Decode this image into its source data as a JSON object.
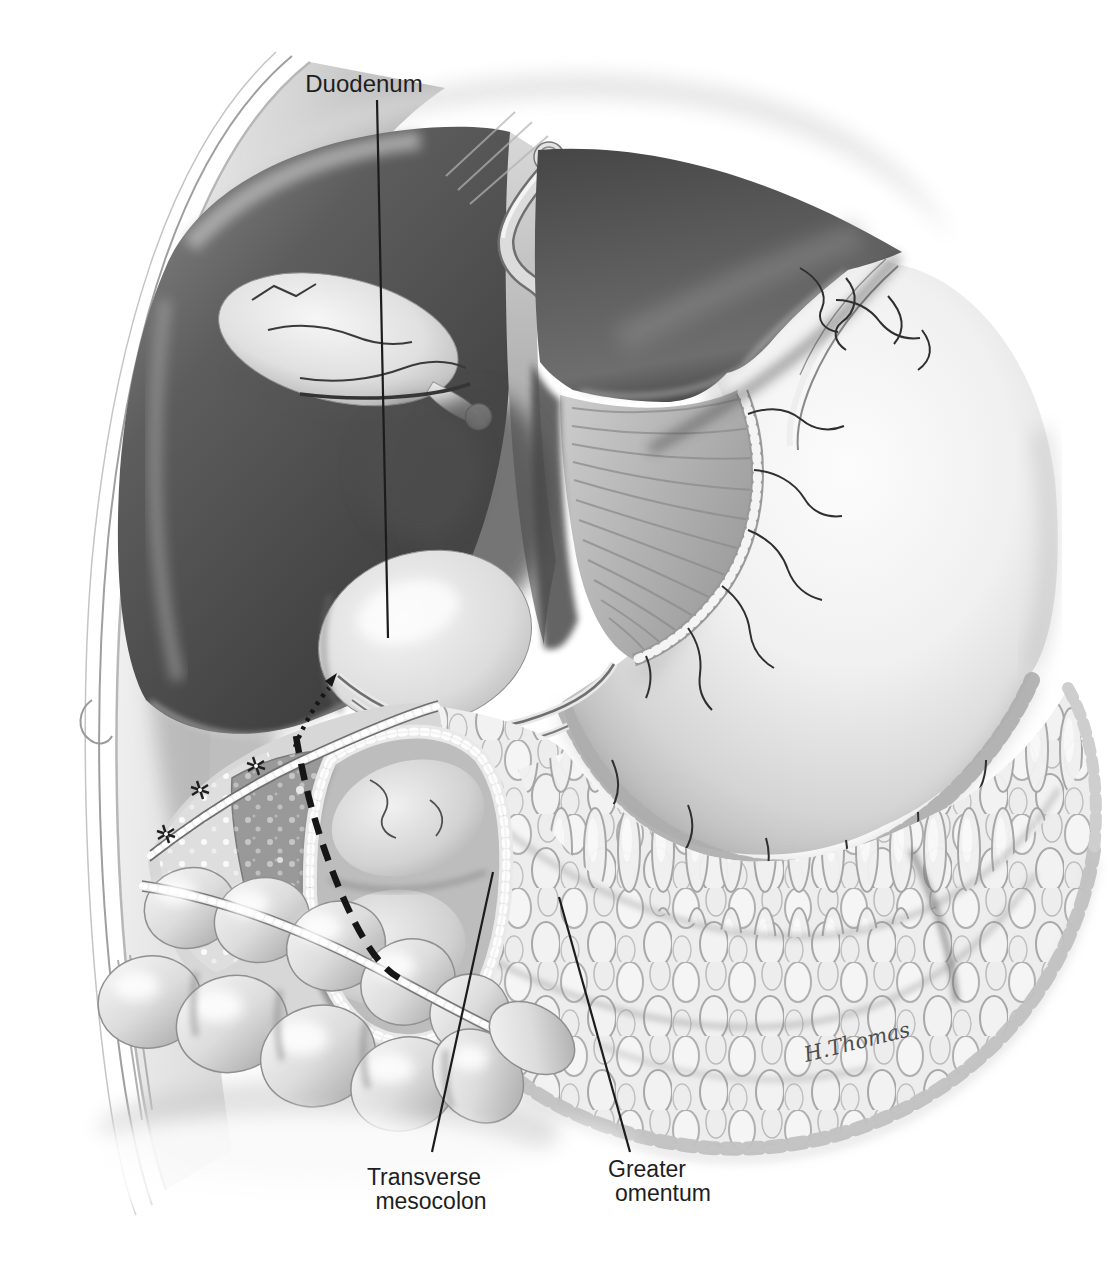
{
  "figure": {
    "kind": "surgical anatomy illustration (grayscale)",
    "background_color": "#ffffff",
    "ink_color": "#1c1c1c",
    "depicts": "Upper abdomen: liver retracted with gallbladder, duodenum, stomach, greater omentum, transverse colon and an opening in the transverse mesocolon with a dashed incision line"
  },
  "labels": {
    "duodenum": {
      "text": "Duodenum"
    },
    "transverse_mesocolon": {
      "line1": "Transverse",
      "line2": "mesocolon"
    },
    "greater_omentum": {
      "line1": "Greater",
      "line2": "omentum"
    }
  },
  "signature": {
    "text": "H.Thomas"
  },
  "palette": {
    "liver_dark": "#4a4a4a",
    "organ_light": "#f2f2f2",
    "membrane_gray": "#d7d7d7",
    "mid_gray": "#b9b9b9",
    "shadow_gray": "#6e6e6e",
    "label_color": "#1e1e1e",
    "signature_color": "#4d4d4d"
  }
}
